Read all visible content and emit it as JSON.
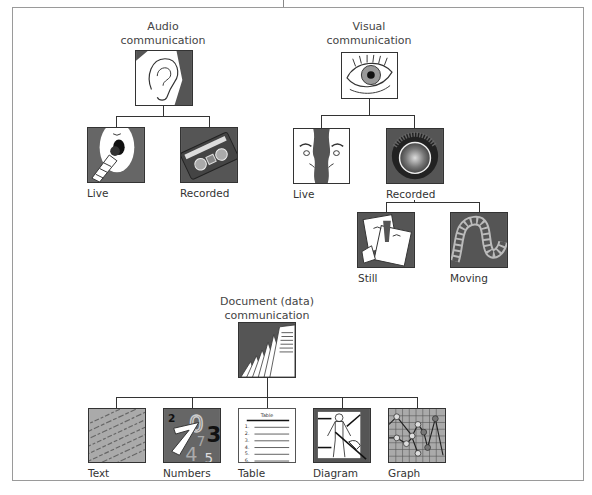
{
  "diagram": {
    "groups": [
      {
        "id": "audio",
        "title_line1": "Audio",
        "title_line2": "communication",
        "icon": "ear-icon",
        "children": [
          {
            "label": "Live",
            "icon": "microphone-mouth-icon"
          },
          {
            "label": "Recorded",
            "icon": "cassette-tape-icon"
          }
        ]
      },
      {
        "id": "visual",
        "title_line1": "Visual",
        "title_line2": "communication",
        "icon": "eye-icon",
        "children": [
          {
            "label": "Live",
            "icon": "faces-profile-icon"
          },
          {
            "label": "Recorded",
            "icon": "camera-lens-icon",
            "children": [
              {
                "label": "Still",
                "icon": "photographs-icon"
              },
              {
                "label": "Moving",
                "icon": "film-reel-icon"
              }
            ]
          }
        ]
      },
      {
        "id": "document",
        "title_line1": "Document (data)",
        "title_line2": "communication",
        "icon": "stacked-pages-icon",
        "children": [
          {
            "label": "Text",
            "icon": "text-page-icon"
          },
          {
            "label": "Numbers",
            "icon": "numbers-icon"
          },
          {
            "label": "Table",
            "icon": "table-icon",
            "inner_title": "Table",
            "rows": [
              "1.",
              "2.",
              "3.",
              "4.",
              "5.",
              "6."
            ]
          },
          {
            "label": "Diagram",
            "icon": "body-diagram-icon"
          },
          {
            "label": "Graph",
            "icon": "line-graph-icon"
          }
        ]
      }
    ],
    "colors": {
      "icon_dark": "#555555",
      "icon_mid": "#8a8a8a",
      "icon_light": "#bdbdbd",
      "line": "#333333",
      "frame": "#9a9a9a"
    }
  }
}
